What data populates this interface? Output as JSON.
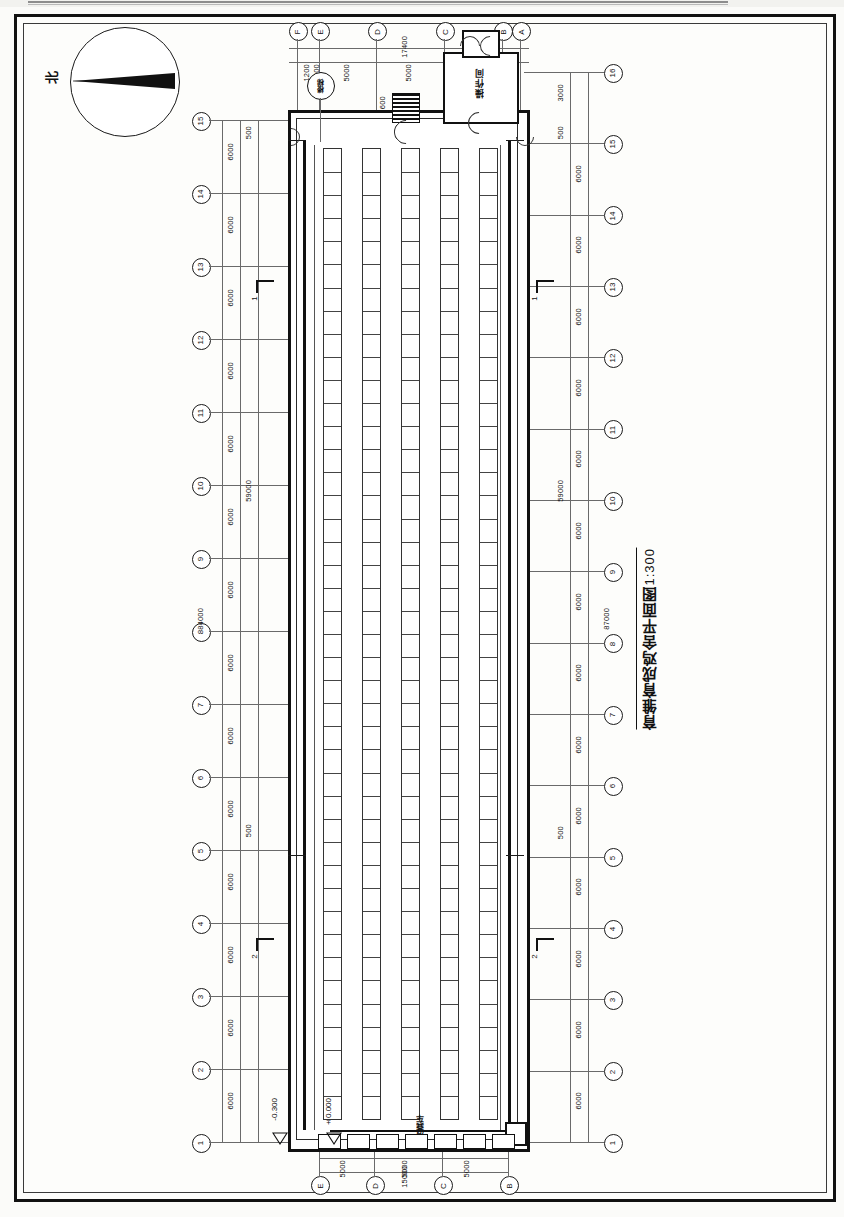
{
  "sheet": {
    "title": "育雏育成鸡舍平面图",
    "scale": "1:300",
    "north_label": "北"
  },
  "rooms": [
    {
      "name": "操作间"
    },
    {
      "name": "清粪车"
    }
  ],
  "tag_bubble": {
    "label": "楼梯"
  },
  "elevations": [
    {
      "value": "-0.300"
    },
    {
      "value": "±0.000"
    }
  ],
  "section_marks": [
    {
      "label": "1"
    },
    {
      "label": "1"
    },
    {
      "label": "2"
    },
    {
      "label": "2"
    }
  ],
  "grid_top_letters": [
    "F",
    "E",
    "D",
    "C",
    "B",
    "A"
  ],
  "grid_bottom_letters": [
    "E",
    "D",
    "C",
    "B"
  ],
  "grid_left_numbers": [
    "15",
    "14",
    "13",
    "12",
    "11",
    "10",
    "9",
    "8",
    "7",
    "6",
    "5",
    "4",
    "3",
    "2",
    "1"
  ],
  "grid_right_numbers": [
    "16",
    "15",
    "14",
    "13",
    "12",
    "11",
    "10",
    "9",
    "8",
    "7",
    "6",
    "5",
    "4",
    "3",
    "2",
    "1"
  ],
  "dimensions": {
    "top_chain": [
      "1200",
      "1200",
      "5000",
      "5000",
      "5000",
      "1200"
    ],
    "top_total": "17400",
    "bottom_chain": [
      "5000",
      "5000",
      "5000"
    ],
    "bottom_total": "15000",
    "left_bay": "6000",
    "left_offset": "500",
    "left_partial": "59000",
    "left_total": "84000",
    "right_bay": "6000",
    "right_offset": "500",
    "right_end": "3000",
    "right_partial": "59000",
    "right_total": "87000",
    "door_width": "600"
  },
  "colors": {
    "ink": "#111111",
    "paper": "#fdfdfb",
    "thin": "#6a6a6a"
  }
}
